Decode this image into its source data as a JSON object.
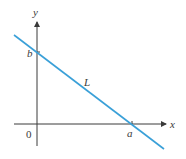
{
  "diagram": {
    "type": "line-intercepts",
    "colors": {
      "axis": "#3a3a3a",
      "line": "#3aa0d8",
      "background": "#ffffff"
    },
    "axes": {
      "x_label": "x",
      "y_label": "y",
      "origin_label": "0"
    },
    "line": {
      "label": "L",
      "y_intercept_label": "b",
      "x_intercept_label": "a"
    }
  }
}
